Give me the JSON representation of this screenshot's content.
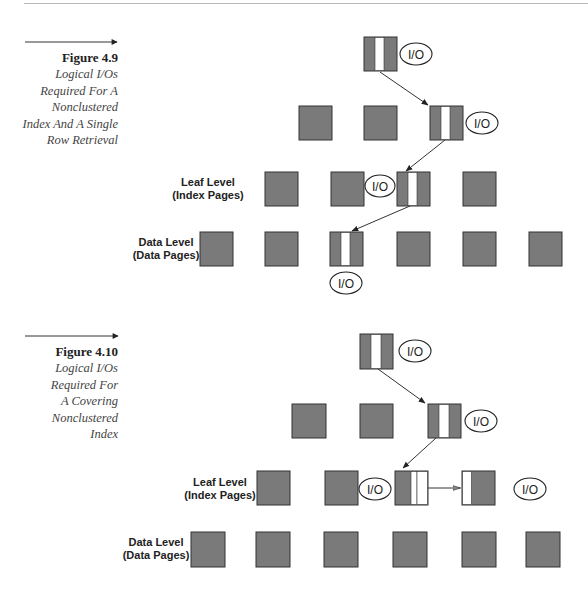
{
  "figures": [
    {
      "id": "fig-4-9",
      "title": "Figure 4.9",
      "caption_lines": [
        "Logical I/Os",
        "Required For A",
        "Nonclustered",
        "Index And A Single",
        "Row Retrieval"
      ],
      "level_labels": {
        "leaf": [
          "Leaf Level",
          "(Index Pages)"
        ],
        "data": [
          "Data Level",
          "(Data Pages)"
        ]
      },
      "io_label": "I/O",
      "levels": {
        "root": {
          "count": 1,
          "selected_index": 0
        },
        "intermediate": {
          "count": 3,
          "selected_index": 2
        },
        "leaf": {
          "count": 4,
          "selected_index": 2
        },
        "data": {
          "count": 6,
          "selected_index": 2
        }
      },
      "io_count": 4
    },
    {
      "id": "fig-4-10",
      "title": "Figure 4.10",
      "caption_lines": [
        "Logical I/Os",
        "Required For",
        "A Covering",
        "Nonclustered",
        "Index"
      ],
      "level_labels": {
        "leaf": [
          "Leaf Level",
          "(Index Pages)"
        ],
        "data": [
          "Data Level",
          "(Data Pages)"
        ]
      },
      "io_label": "I/O",
      "levels": {
        "root": {
          "count": 1,
          "selected_index": 0
        },
        "intermediate": {
          "count": 3,
          "selected_index": 2
        },
        "leaf": {
          "count": 4,
          "selected_index": 2,
          "next_page_index": 3
        },
        "data": {
          "count": 6,
          "selected_index": null
        }
      },
      "io_count": 4
    }
  ],
  "colors": {
    "page_fill": "#7a7a7a",
    "page_stroke": "#333333",
    "stripe": "#ffffff",
    "text": "#222222"
  }
}
